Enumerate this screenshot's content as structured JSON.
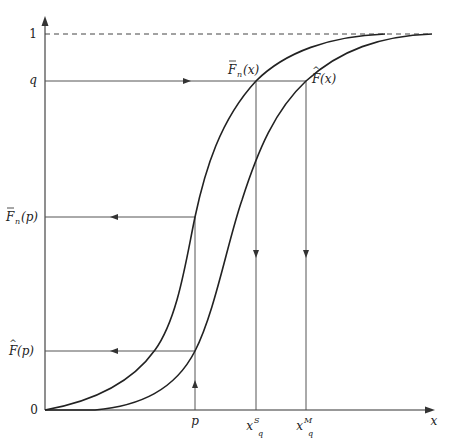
{
  "diagram": {
    "y_axis": {
      "ticks": [
        {
          "label": "1",
          "y": 34
        },
        {
          "label": "q",
          "y": 81
        },
        {
          "label_main": "F",
          "label_accent": "‾",
          "label_sub": "n",
          "label_arg": "(p)",
          "y": 217
        },
        {
          "label_main": "F",
          "label_accent": "^",
          "label_arg": "(p)",
          "y": 351
        },
        {
          "label": "0",
          "y": 410
        }
      ]
    },
    "x_axis": {
      "label": "x",
      "ticks": [
        {
          "label": "p",
          "x": 195
        },
        {
          "label": "x",
          "sup": "S",
          "sub": "q",
          "x": 256
        },
        {
          "label": "x",
          "sup": "M",
          "sub": "q",
          "x": 306
        }
      ]
    },
    "curves": [
      {
        "name": "empirical-smoothed-cdf",
        "label_main": "F",
        "label_accent": "‾",
        "label_sub": "n",
        "label_arg": "(x)"
      },
      {
        "name": "estimated-cdf",
        "label_main": "F",
        "label_accent": "^",
        "label_arg": "(x)"
      }
    ],
    "labels": {
      "one": "1",
      "q": "q",
      "zero": "0",
      "x": "x",
      "p": "p",
      "fbar_p_F": "F",
      "fbar_p_sub": "n",
      "fbar_p_arg": "(p)",
      "fhat_p_F": "F",
      "fhat_p_arg": "(p)",
      "fbar_x_F": "F",
      "fbar_x_sub": "n",
      "fbar_x_arg": "(x)",
      "fhat_x_F": "F",
      "fhat_x_arg": "(x)",
      "xqS_x": "x",
      "xqS_sup": "S",
      "xqS_sub": "q",
      "xqM_x": "x",
      "xqM_sup": "M",
      "xqM_sub": "q"
    },
    "colors": {
      "axis": "#333333",
      "curve": "#222222",
      "guide": "#555555",
      "dashed": "#444444"
    }
  }
}
